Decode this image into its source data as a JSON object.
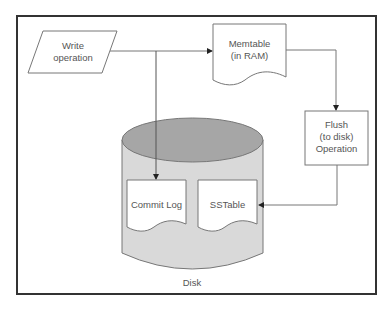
{
  "diagram": {
    "nodes": {
      "write_operation": {
        "line1": "Write",
        "line2": "operation"
      },
      "memtable": {
        "line1": "Memtable",
        "line2": "(in RAM)"
      },
      "flush": {
        "line1": "Flush",
        "line2": "(to disk)",
        "line3": "Operation"
      },
      "commit_log": {
        "label": "Commit Log"
      },
      "sstable": {
        "label": "SSTable"
      },
      "disk": {
        "label": "Disk"
      }
    },
    "edges": [
      {
        "from": "Write operation",
        "to": "Memtable"
      },
      {
        "from": "Write operation",
        "to": "Commit Log"
      },
      {
        "from": "Memtable",
        "to": "Flush (to disk) Operation"
      },
      {
        "from": "Flush (to disk) Operation",
        "to": "SSTable"
      }
    ],
    "colors": {
      "frame": "#333333",
      "stroke": "#777777",
      "disk_top": "#a6a6a6",
      "disk_body": "#d9d9d9",
      "text": "#555555"
    }
  }
}
